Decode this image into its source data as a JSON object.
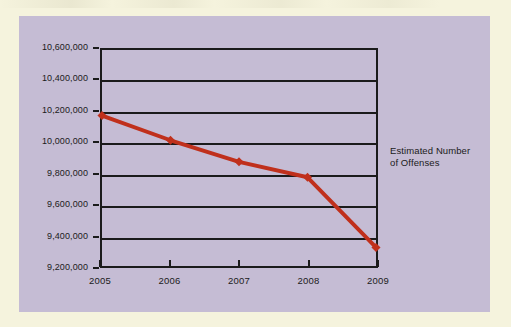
{
  "page": {
    "background_color": "#f5f3dd",
    "panel_color": "#c5bcd4"
  },
  "chart_data": {
    "type": "line",
    "title": "",
    "xlabel": "",
    "ylabel": "",
    "categories": [
      "2005",
      "2006",
      "2007",
      "2008",
      "2009"
    ],
    "x": [
      2005,
      2006,
      2007,
      2008,
      2009
    ],
    "values": [
      10175000,
      10015000,
      9875000,
      9775000,
      9320000
    ],
    "series": [
      {
        "name": "Estimated Number of Offenses",
        "color": "#c0301c",
        "marker": "diamond",
        "values": [
          10175000,
          10015000,
          9875000,
          9775000,
          9320000
        ]
      }
    ],
    "ylim": [
      9200000,
      10600000
    ],
    "ytick_values": [
      10600000,
      10400000,
      10200000,
      10000000,
      9800000,
      9600000,
      9400000,
      9200000
    ],
    "ytick_labels": [
      "10,600,000",
      "10,400,000",
      "10,200,000",
      "10,000,000",
      "9,800,000",
      "9,600,000",
      "9,400,000",
      "9,200,000"
    ],
    "xtick_labels": [
      "2005",
      "2006",
      "2007",
      "2008",
      "2009"
    ],
    "grid": "horizontal",
    "legend_position": "right",
    "annotations": []
  },
  "series_label": {
    "line1": "Estimated Number",
    "line2": "of Offenses"
  },
  "colors": {
    "line": "#c0301c",
    "axis": "#1b1b1b",
    "grid": "#1b1b1b",
    "panel": "#c5bcd4",
    "page": "#f5f3dd"
  }
}
